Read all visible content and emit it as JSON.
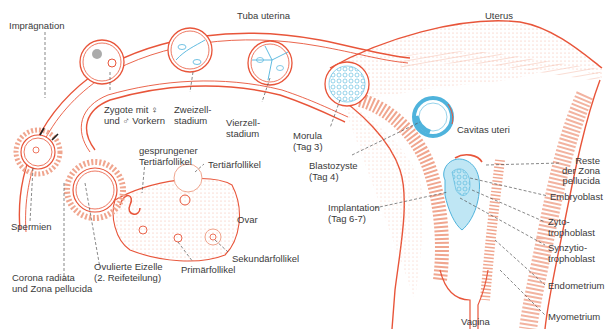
{
  "diagram": {
    "type": "anatomical-illustration",
    "colors": {
      "tissue": "#e8553a",
      "tissue_light": "#f4b7a4",
      "embryo": "#4fb3dc",
      "embryo_light": "#bfe6f4",
      "label_text": "#3a3a3a",
      "leader_line": "#555555"
    },
    "labels": {
      "tuba_uterina": "Tuba uterina",
      "uterus": "Uterus",
      "impraegnation": "Imprägnation",
      "zygote_line1": "Zygote mit ♀",
      "zygote_line2": "und ♂ Vorkern",
      "zweizell_line1": "Zweizell-",
      "zweizell_line2": "stadium",
      "vierzell_line1": "Vierzell-",
      "vierzell_line2": "stadium",
      "morula_line1": "Morula",
      "morula_line2": "(Tag 3)",
      "blastozyste_line1": "Blastozyste",
      "blastozyste_line2": "(Tag 4)",
      "cavitas_uteri": "Cavitas uteri",
      "implantation_line1": "Implantation",
      "implantation_line2": "(Tag 6-7)",
      "reste_line1": "Reste",
      "reste_line2": "der Zona",
      "reste_line3": "pellucida",
      "embryoblast": "Embryoblast",
      "zytotrophoblast_line1": "Zyto-",
      "zytotrophoblast_line2": "trophoblast",
      "synzytiotrophoblast_line1": "Synzytio-",
      "synzytiotrophoblast_line2": "trophoblast",
      "endometrium": "Endometrium",
      "myometrium": "Myometrium",
      "vagina": "Vagina",
      "gesprungener_line1": "gesprungener",
      "gesprungener_line2": "Tertiärfollikel",
      "tertiaerfollikel": "Tertiärfollikel",
      "ovar": "Ovar",
      "sekundaerfollikel": "Sekundärfollikel",
      "primaerfollikel": "Primärfollikel",
      "ovulierte_line1": "Ovulierte Eizelle",
      "ovulierte_line2": "(2. Reifeteilung)",
      "spermien": "Spermien",
      "corona_line1": "Corona radiata",
      "corona_line2": "und Zona pellucida"
    }
  }
}
